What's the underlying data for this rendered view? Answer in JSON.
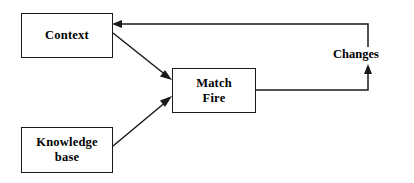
{
  "diagram": {
    "type": "flow-diagram",
    "canvas": {
      "width": 414,
      "height": 183,
      "background": "#ffffff"
    },
    "stroke_color": "#1a1a1a",
    "text_color": "#000000",
    "nodes": [
      {
        "id": "context",
        "label": "Context",
        "shape": "rectangle",
        "x": 21,
        "y": 13,
        "width": 92,
        "height": 45
      },
      {
        "id": "match-fire",
        "label": "Match\nFire",
        "shape": "rectangle",
        "x": 172,
        "y": 68,
        "width": 84,
        "height": 45
      },
      {
        "id": "knowledge-base",
        "label": "Knowledge\nbase",
        "shape": "rectangle",
        "x": 21,
        "y": 127,
        "width": 92,
        "height": 46
      }
    ],
    "edges": [
      {
        "id": "context-to-match-fire",
        "from": "context",
        "to": "match-fire",
        "label": "",
        "style": "solid",
        "arrowhead": "filled-triangle"
      },
      {
        "id": "knowledge-base-to-match-fire",
        "from": "knowledge-base",
        "to": "match-fire",
        "label": "",
        "style": "solid",
        "arrowhead": "filled-triangle"
      },
      {
        "id": "match-fire-to-changes",
        "from": "match-fire",
        "to": "changes",
        "label": "Changes",
        "style": "solid-orthogonal",
        "arrowhead": "filled-triangle"
      },
      {
        "id": "changes-to-context",
        "from": "changes",
        "to": "context",
        "label": "",
        "style": "solid-orthogonal",
        "arrowhead": "filled-triangle"
      }
    ],
    "captions": [
      {
        "id": "changes",
        "text": "Changes",
        "x": 331,
        "y": 47
      }
    ]
  }
}
